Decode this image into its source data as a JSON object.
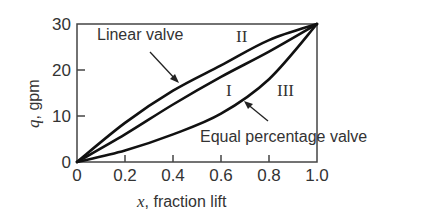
{
  "chart_data": {
    "type": "line",
    "title": "",
    "xlabel_var": "x",
    "xlabel_rest": ", fraction lift",
    "ylabel_var": "q",
    "ylabel_rest": ", gpm",
    "xlim": [
      0,
      1.0
    ],
    "ylim": [
      0,
      30
    ],
    "grid": false,
    "legend": "none (inline annotations)",
    "x_ticks": [
      "0",
      "0.2",
      "0.4",
      "0.6",
      "0.8",
      "1.0"
    ],
    "y_ticks": [
      "0",
      "10",
      "20",
      "30"
    ],
    "x": [
      0,
      0.2,
      0.4,
      0.6,
      0.8,
      1.0
    ],
    "series": [
      {
        "name": "II (Linear valve annotation)",
        "label": "II",
        "values": [
          0,
          8.5,
          15.5,
          21,
          26.5,
          30
        ]
      },
      {
        "name": "I",
        "label": "I",
        "values": [
          0,
          6,
          12.5,
          18.5,
          24,
          30
        ]
      },
      {
        "name": "III (Equal percentage valve)",
        "label": "III",
        "values": [
          0,
          2.5,
          6,
          10.5,
          18,
          30
        ]
      }
    ],
    "annotations": [
      {
        "text": "Linear valve",
        "points_to": "curve II"
      },
      {
        "text": "Equal percentage valve",
        "points_to": "curve III"
      },
      {
        "text": "I"
      },
      {
        "text": "II"
      },
      {
        "text": "III"
      }
    ]
  },
  "labels": {
    "linear_valve": "Linear valve",
    "equal_pct_valve": "Equal percentage valve",
    "roman_I": "I",
    "roman_II": "II",
    "roman_III": "III"
  }
}
